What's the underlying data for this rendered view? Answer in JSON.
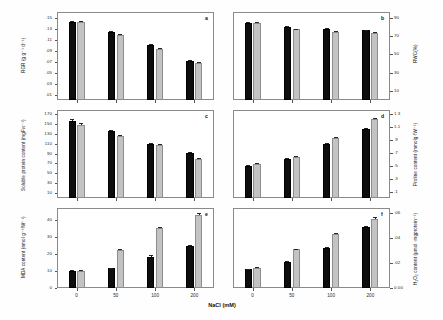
{
  "figure": {
    "xlabel": "NaCl (mM)",
    "categories": [
      "0",
      "50",
      "100",
      "200"
    ],
    "series_names": [
      "black",
      "gray"
    ],
    "colors": {
      "series1": "#0d0d0d",
      "series2": "#c3c3c3",
      "axis": "#8a8a8a"
    }
  },
  "chart_data": [
    {
      "type": "bar",
      "panel": "a",
      "title": "",
      "xlabel": "NaCl (mM)",
      "ylabel": "RGR (g g⁻¹ d⁻¹)",
      "categories": [
        "0",
        "50",
        "100",
        "200"
      ],
      "yticks": [
        ".01",
        ".03",
        ".05",
        ".07",
        ".09",
        ".11",
        ".13",
        ".15"
      ],
      "ylim": [
        0.0,
        0.16
      ],
      "ytick_values": [
        0.01,
        0.03,
        0.05,
        0.07,
        0.09,
        0.11,
        0.13,
        0.15
      ],
      "axis_side": "left",
      "grid": false,
      "legend": "none",
      "series": [
        {
          "name": "black",
          "values": [
            0.142,
            0.123,
            0.1,
            0.071
          ],
          "errors": [
            0.002,
            0.002,
            0.002,
            0.001
          ]
        },
        {
          "name": "gray",
          "values": [
            0.142,
            0.118,
            0.093,
            0.068
          ],
          "errors": [
            0.002,
            0.002,
            0.002,
            0.001
          ]
        }
      ]
    },
    {
      "type": "bar",
      "panel": "b",
      "title": "",
      "xlabel": "NaCl (mM)",
      "ylabel": "RWC(%)",
      "categories": [
        "0",
        "50",
        "100",
        "200"
      ],
      "yticks": [
        "10",
        "30",
        "50",
        "70",
        "90"
      ],
      "ylim": [
        0,
        96
      ],
      "ytick_values": [
        10,
        30,
        50,
        70,
        90
      ],
      "axis_side": "right",
      "grid": false,
      "legend": "none",
      "series": [
        {
          "name": "black",
          "values": [
            84,
            80,
            78,
            76
          ],
          "errors": [
            1.2,
            1.0,
            1.0,
            0.8
          ]
        },
        {
          "name": "gray",
          "values": [
            84,
            77,
            74,
            73
          ],
          "errors": [
            1.2,
            1.0,
            1.0,
            0.8
          ]
        }
      ]
    },
    {
      "type": "bar",
      "panel": "c",
      "title": "",
      "xlabel": "NaCl (mM)",
      "ylabel": "Soluble protein content (mgFw⁻¹)",
      "categories": [
        "0",
        "50",
        "100",
        "200"
      ],
      "yticks": [
        "10",
        "30",
        "50",
        "70",
        "90",
        "110",
        "130",
        "150",
        "170"
      ],
      "ylim": [
        0,
        178
      ],
      "ytick_values": [
        10,
        30,
        50,
        70,
        90,
        110,
        130,
        150,
        170
      ],
      "axis_side": "left",
      "grid": false,
      "legend": "none",
      "series": [
        {
          "name": "black",
          "values": [
            156,
            135,
            110,
            92
          ],
          "errors": [
            3,
            2,
            2,
            2
          ]
        },
        {
          "name": "gray",
          "values": [
            148,
            125,
            108,
            79
          ],
          "errors": [
            3,
            2,
            2,
            2
          ]
        }
      ]
    },
    {
      "type": "bar",
      "panel": "d",
      "title": "",
      "xlabel": "NaCl (mM)",
      "ylabel": "Proline content (mmolg·fW⁻¹)",
      "categories": [
        "0",
        "50",
        "100",
        "200"
      ],
      "yticks": [
        ".1",
        ".3",
        ".5",
        ".7",
        ".9",
        "1.1",
        "1.3"
      ],
      "ylim": [
        0.0,
        1.36
      ],
      "ytick_values": [
        0.1,
        0.3,
        0.5,
        0.7,
        0.9,
        1.1,
        1.3
      ],
      "axis_side": "right",
      "grid": false,
      "legend": "none",
      "series": [
        {
          "name": "black",
          "values": [
            0.5,
            0.6,
            0.83,
            1.07
          ],
          "errors": [
            0.015,
            0.015,
            0.015,
            0.015
          ]
        },
        {
          "name": "gray",
          "values": [
            0.52,
            0.63,
            0.93,
            1.22
          ],
          "errors": [
            0.015,
            0.015,
            0.015,
            0.015
          ]
        }
      ]
    },
    {
      "type": "bar",
      "panel": "e",
      "title": "",
      "xlabel": "NaCl (mM)",
      "ylabel": "MDA content (nmol g⁻¹fW⁻¹)",
      "categories": [
        "0",
        "50",
        "100",
        "200"
      ],
      "yticks": [
        "0",
        "10",
        "20",
        "30",
        "40"
      ],
      "ylim": [
        0,
        47
      ],
      "ytick_values": [
        0,
        10,
        20,
        30,
        40
      ],
      "axis_side": "left",
      "grid": false,
      "legend": "none",
      "series": [
        {
          "name": "black",
          "values": [
            10.0,
            11.5,
            18.5,
            24.5
          ],
          "errors": [
            0.4,
            0.5,
            0.8,
            1.0
          ]
        },
        {
          "name": "gray",
          "values": [
            10.2,
            22.5,
            35.0,
            43.0
          ],
          "errors": [
            0.4,
            0.6,
            1.0,
            1.2
          ]
        }
      ]
    },
    {
      "type": "bar",
      "panel": "f",
      "title": "",
      "xlabel": "NaCl (mM)",
      "ylabel": "H₂O₂ content (µmol ·mgprotein⁻¹)",
      "categories": [
        "0",
        "50",
        "100",
        "200"
      ],
      "yticks": [
        "0.00",
        ".02",
        ".04",
        ".06"
      ],
      "ylim": [
        0.0,
        0.064
      ],
      "ytick_values": [
        0.0,
        0.02,
        0.04,
        0.06
      ],
      "axis_side": "right",
      "grid": false,
      "legend": "none",
      "series": [
        {
          "name": "black",
          "values": [
            0.015,
            0.021,
            0.032,
            0.049
          ],
          "errors": [
            0.0006,
            0.0006,
            0.0006,
            0.0008
          ]
        },
        {
          "name": "gray",
          "values": [
            0.016,
            0.031,
            0.043,
            0.0555
          ],
          "errors": [
            0.0006,
            0.0006,
            0.0008,
            0.001
          ]
        }
      ]
    }
  ],
  "panel_labels": {
    "a": "a",
    "b": "b",
    "c": "c",
    "d": "d",
    "e": "e",
    "f": "f"
  }
}
